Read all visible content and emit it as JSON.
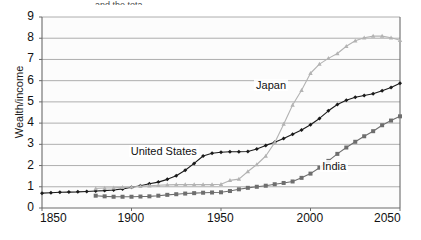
{
  "top_cropped_text": "and the tota",
  "axes": {
    "ylabel": "Wealth/income",
    "xlabel": "",
    "ylim": [
      0,
      9
    ],
    "xlim": [
      1850,
      2050
    ],
    "yticks": [
      0,
      1,
      2,
      3,
      4,
      5,
      6,
      7,
      8,
      9
    ],
    "xticks": [
      1850,
      1900,
      1950,
      2000,
      2050
    ],
    "grid": "horizontal"
  },
  "colors": {
    "united_states": "#1a1a1a",
    "japan": "#b3b3b3",
    "india": "#6e6e6e",
    "gridline": "#9a9a9a",
    "axis": "#6a6a6a",
    "plot_background": "#fcfcfc"
  },
  "chart_data": {
    "type": "line",
    "title": "",
    "xlabel": "",
    "ylabel": "Wealth/income",
    "xlim": [
      1850,
      2050
    ],
    "ylim": [
      0,
      9
    ],
    "grid": true,
    "legend": "inline-labels",
    "series": [
      {
        "name": "United States",
        "marker": "diamond",
        "color": "#1a1a1a",
        "label_x": 1913,
        "label_y": 2.62,
        "points": [
          [
            1850,
            0.7
          ],
          [
            1855,
            0.72
          ],
          [
            1860,
            0.74
          ],
          [
            1865,
            0.75
          ],
          [
            1870,
            0.76
          ],
          [
            1875,
            0.78
          ],
          [
            1880,
            0.8
          ],
          [
            1885,
            0.82
          ],
          [
            1890,
            0.85
          ],
          [
            1895,
            0.9
          ],
          [
            1900,
            0.98
          ],
          [
            1905,
            1.05
          ],
          [
            1910,
            1.14
          ],
          [
            1915,
            1.22
          ],
          [
            1920,
            1.35
          ],
          [
            1925,
            1.52
          ],
          [
            1930,
            1.78
          ],
          [
            1935,
            2.1
          ],
          [
            1940,
            2.45
          ],
          [
            1945,
            2.58
          ],
          [
            1950,
            2.63
          ],
          [
            1955,
            2.65
          ],
          [
            1960,
            2.65
          ],
          [
            1965,
            2.66
          ],
          [
            1970,
            2.78
          ],
          [
            1975,
            2.95
          ],
          [
            1980,
            3.1
          ],
          [
            1985,
            3.28
          ],
          [
            1990,
            3.48
          ],
          [
            1995,
            3.68
          ],
          [
            2000,
            3.92
          ],
          [
            2005,
            4.22
          ],
          [
            2010,
            4.58
          ],
          [
            2015,
            4.88
          ],
          [
            2020,
            5.08
          ],
          [
            2025,
            5.22
          ],
          [
            2030,
            5.3
          ],
          [
            2035,
            5.38
          ],
          [
            2040,
            5.52
          ],
          [
            2045,
            5.68
          ],
          [
            2050,
            5.88
          ]
        ]
      },
      {
        "name": "Japan",
        "marker": "triangle",
        "color": "#b3b3b3",
        "label_x": 1983,
        "label_y": 5.75,
        "points": [
          [
            1880,
            0.92
          ],
          [
            1885,
            0.94
          ],
          [
            1890,
            0.95
          ],
          [
            1895,
            0.97
          ],
          [
            1900,
            0.99
          ],
          [
            1905,
            1.02
          ],
          [
            1910,
            1.05
          ],
          [
            1915,
            1.07
          ],
          [
            1920,
            1.09
          ],
          [
            1925,
            1.1
          ],
          [
            1930,
            1.1
          ],
          [
            1935,
            1.1
          ],
          [
            1940,
            1.1
          ],
          [
            1945,
            1.1
          ],
          [
            1950,
            1.12
          ],
          [
            1955,
            1.3
          ],
          [
            1960,
            1.36
          ],
          [
            1965,
            1.72
          ],
          [
            1970,
            2.05
          ],
          [
            1975,
            2.45
          ],
          [
            1980,
            3.08
          ],
          [
            1985,
            3.95
          ],
          [
            1990,
            4.85
          ],
          [
            1995,
            5.55
          ],
          [
            2000,
            6.35
          ],
          [
            2005,
            6.78
          ],
          [
            2010,
            7.05
          ],
          [
            2015,
            7.28
          ],
          [
            2020,
            7.62
          ],
          [
            2025,
            7.88
          ],
          [
            2030,
            8.02
          ],
          [
            2035,
            8.1
          ],
          [
            2040,
            8.1
          ],
          [
            2045,
            8.02
          ],
          [
            2050,
            7.9
          ]
        ]
      },
      {
        "name": "India",
        "marker": "square",
        "color": "#6e6e6e",
        "label_x": 2020,
        "label_y": 1.95,
        "points": [
          [
            1880,
            0.58
          ],
          [
            1885,
            0.55
          ],
          [
            1890,
            0.53
          ],
          [
            1895,
            0.53
          ],
          [
            1900,
            0.53
          ],
          [
            1905,
            0.54
          ],
          [
            1910,
            0.55
          ],
          [
            1915,
            0.58
          ],
          [
            1920,
            0.62
          ],
          [
            1925,
            0.65
          ],
          [
            1930,
            0.68
          ],
          [
            1935,
            0.7
          ],
          [
            1940,
            0.72
          ],
          [
            1945,
            0.73
          ],
          [
            1950,
            0.74
          ],
          [
            1955,
            0.8
          ],
          [
            1960,
            0.88
          ],
          [
            1965,
            0.95
          ],
          [
            1970,
            1.0
          ],
          [
            1975,
            1.05
          ],
          [
            1980,
            1.12
          ],
          [
            1985,
            1.18
          ],
          [
            1990,
            1.25
          ],
          [
            1995,
            1.42
          ],
          [
            2000,
            1.62
          ],
          [
            2005,
            1.9
          ],
          [
            2010,
            2.22
          ],
          [
            2015,
            2.55
          ],
          [
            2020,
            2.85
          ],
          [
            2025,
            3.12
          ],
          [
            2030,
            3.38
          ],
          [
            2035,
            3.62
          ],
          [
            2040,
            3.9
          ],
          [
            2045,
            4.12
          ],
          [
            2050,
            4.32
          ]
        ]
      }
    ]
  }
}
